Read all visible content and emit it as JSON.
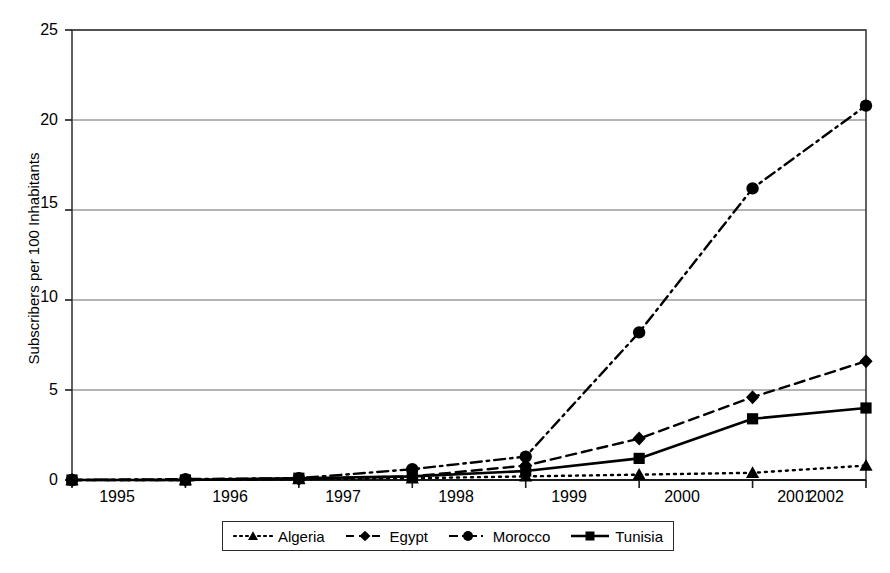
{
  "chart_data": {
    "type": "line",
    "title": "",
    "xlabel": "",
    "ylabel": "Subscribers per 100 Inhabitants",
    "x": [
      "1995",
      "1996",
      "1997",
      "1998",
      "1999",
      "2000",
      "2001",
      "2002"
    ],
    "categories": [
      "1995",
      "1996",
      "1997",
      "1998",
      "1999",
      "2000",
      "2001",
      "2002"
    ],
    "xlim": [
      1995,
      2002
    ],
    "ylim": [
      0,
      25
    ],
    "yticks": [
      0,
      5,
      10,
      15,
      20,
      25
    ],
    "ytick_labels": [
      "0",
      "5",
      "10",
      "15",
      "20",
      "25"
    ],
    "grid": "horizontal",
    "legend_position": "bottom",
    "series": [
      {
        "name": "Algeria",
        "marker": "triangle",
        "line_style": "dotted",
        "color": "#000000",
        "values": [
          0.0,
          0.0,
          0.05,
          0.1,
          0.2,
          0.3,
          0.4,
          0.8
        ]
      },
      {
        "name": "Egypt",
        "marker": "diamond",
        "line_style": "dashed",
        "color": "#000000",
        "values": [
          0.0,
          0.0,
          0.05,
          0.2,
          0.8,
          2.3,
          4.6,
          6.6
        ]
      },
      {
        "name": "Morocco",
        "marker": "circle",
        "line_style": "dash-dot",
        "color": "#000000",
        "values": [
          0.0,
          0.05,
          0.1,
          0.6,
          1.3,
          8.2,
          16.2,
          20.8
        ]
      },
      {
        "name": "Tunisia",
        "marker": "square",
        "line_style": "solid",
        "color": "#000000",
        "values": [
          0.0,
          0.0,
          0.1,
          0.2,
          0.5,
          1.2,
          3.4,
          4.0
        ]
      }
    ]
  },
  "legend": {
    "items": [
      {
        "label": "Algeria"
      },
      {
        "label": "Egypt"
      },
      {
        "label": "Morocco"
      },
      {
        "label": "Tunisia"
      }
    ]
  },
  "axis": {
    "y_title": "Subscribers per 100 Inhabitants"
  },
  "colors": {
    "ink": "#000000",
    "grid": "#6b6b6b",
    "frame": "#3a3a3a",
    "background": "#ffffff"
  }
}
